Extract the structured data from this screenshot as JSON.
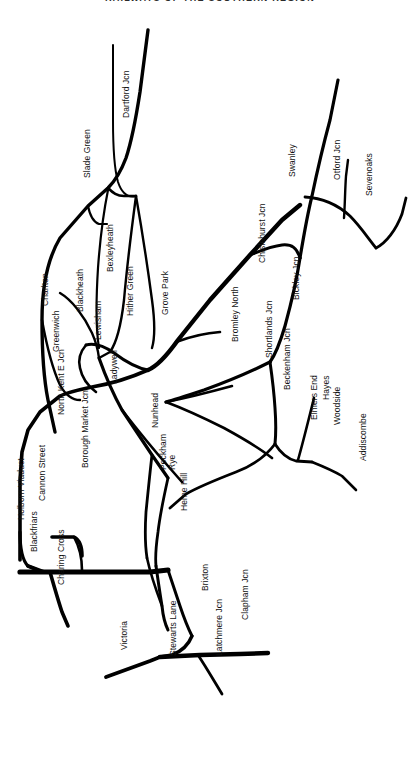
{
  "header": {
    "title": "RAILWAYS OF THE SOUTHERN REGION"
  },
  "map": {
    "name": "southern-region-railway-schematic",
    "background_color": "#ffffff",
    "line_color": "#000000",
    "label_color": "#111111",
    "width": 420,
    "height": 770,
    "label_orientation": "rotated -90 degrees (bottom-to-top)"
  },
  "stations": [
    {
      "id": "dartford-jcn",
      "label": "Dartford Jcn",
      "x": 122,
      "y": 118,
      "angle": -90
    },
    {
      "id": "slade-green",
      "label": "Slade Green",
      "x": 83,
      "y": 178,
      "angle": -90
    },
    {
      "id": "swanley",
      "label": "Swanley",
      "x": 288,
      "y": 177,
      "angle": -90
    },
    {
      "id": "otford-jcn",
      "label": "Otford Jcn",
      "x": 333,
      "y": 180,
      "angle": -90
    },
    {
      "id": "sevenoaks",
      "label": "Sevenoaks",
      "x": 365,
      "y": 196,
      "angle": -90
    },
    {
      "id": "bexleyheath",
      "label": "Bexleyheath",
      "x": 106,
      "y": 272,
      "angle": -90
    },
    {
      "id": "charlton",
      "label": "Charlton",
      "x": 41,
      "y": 306,
      "angle": -90
    },
    {
      "id": "blackheath",
      "label": "Blackheath",
      "x": 76,
      "y": 312,
      "angle": -90
    },
    {
      "id": "hither-green",
      "label": "Hither Green",
      "x": 126,
      "y": 316,
      "angle": -90
    },
    {
      "id": "chislehurst-jcn",
      "label": "Chislehurst Jcn",
      "x": 258,
      "y": 263,
      "angle": -90
    },
    {
      "id": "grove-park",
      "label": "Grove Park",
      "x": 161,
      "y": 315,
      "angle": -90
    },
    {
      "id": "bickley-jcn",
      "label": "Bickley Jcn",
      "x": 292,
      "y": 300,
      "angle": -90
    },
    {
      "id": "lewisham",
      "label": "Lewisham",
      "x": 94,
      "y": 340,
      "angle": -90
    },
    {
      "id": "greenwich",
      "label": "Greenwich",
      "x": 52,
      "y": 352,
      "angle": -90
    },
    {
      "id": "bromley-north",
      "label": "Bromley North",
      "x": 231,
      "y": 342,
      "angle": -90
    },
    {
      "id": "shortlands-jcn",
      "label": "Shortlands Jcn",
      "x": 265,
      "y": 358,
      "angle": -90
    },
    {
      "id": "ladywell",
      "label": "Ladywell",
      "x": 110,
      "y": 384,
      "angle": -90
    },
    {
      "id": "beckenham-jcn",
      "label": "Beckenham Jcn",
      "x": 283,
      "y": 390,
      "angle": -90
    },
    {
      "id": "hayes",
      "label": "Hayes",
      "x": 322,
      "y": 400,
      "angle": -90
    },
    {
      "id": "north-kent-e-jcn",
      "label": "North Kent E Jcn",
      "x": 57,
      "y": 415,
      "angle": -90
    },
    {
      "id": "elmers-end",
      "label": "Elmers End",
      "x": 310,
      "y": 420,
      "angle": -90
    },
    {
      "id": "woodside",
      "label": "Woodside",
      "x": 333,
      "y": 425,
      "angle": -90
    },
    {
      "id": "nunhead",
      "label": "Nunhead",
      "x": 151,
      "y": 428,
      "angle": -90
    },
    {
      "id": "borough-market-jcn",
      "label": "Borough Market Jcn",
      "x": 81,
      "y": 468,
      "angle": -90
    },
    {
      "id": "peckham-rye",
      "label": "Peckham\nRye",
      "x": 159,
      "y": 470,
      "angle": -90,
      "two_line": true
    },
    {
      "id": "addiscombe",
      "label": "Addiscombe",
      "x": 359,
      "y": 461,
      "angle": -90
    },
    {
      "id": "cannon-street",
      "label": "Cannon Street",
      "x": 38,
      "y": 501,
      "angle": -90
    },
    {
      "id": "herne-hill",
      "label": "Herne Hill",
      "x": 180,
      "y": 511,
      "angle": -90
    },
    {
      "id": "holborn-viaduct",
      "label": "Holborn Viaduct",
      "x": 17,
      "y": 520,
      "angle": -90
    },
    {
      "id": "blackfriars",
      "label": "Blackfriars",
      "x": 30,
      "y": 552,
      "angle": -90
    },
    {
      "id": "charing-cross",
      "label": "Charing Cross",
      "x": 57,
      "y": 585,
      "angle": -90
    },
    {
      "id": "brixton",
      "label": "Brixton",
      "x": 201,
      "y": 591,
      "angle": -90
    },
    {
      "id": "clapham-jcn",
      "label": "Clapham Jcn",
      "x": 241,
      "y": 620,
      "angle": -90
    },
    {
      "id": "victoria",
      "label": "Victoria",
      "x": 120,
      "y": 650,
      "angle": -90
    },
    {
      "id": "stewarts-lane",
      "label": "Stewarts Lane",
      "x": 169,
      "y": 656,
      "angle": -90
    },
    {
      "id": "latchmere-jcn",
      "label": "Latchmere Jcn",
      "x": 215,
      "y": 656,
      "angle": -90
    }
  ],
  "lines": [
    {
      "id": "dartford-main",
      "name": "Dartford Jcn to Slade Green / North Kent",
      "d": "M 148 30 L 140 92 C 136 118 132 140 126 158 C 120 174 114 182 108 188 L 88 206 L 60 238 C 48 258 42 285 42 320 C 42 355 44 380 48 400 L 55 432",
      "w": 3.4
    },
    {
      "id": "dartford-up",
      "name": "Dartford Jcn approach from north-east",
      "d": "M 113 45 L 113 120 C 113 148 114 168 118 182 C 122 194 128 198 136 196",
      "w": 2.0
    },
    {
      "id": "slade-green-link",
      "name": "Slade Green connecting curve",
      "d": "M 108 188 C 113 193 117 196 124 196 L 136 196",
      "w": 2.6
    },
    {
      "id": "bexleyheath-loop",
      "name": "Bexleyheath loop",
      "d": "M 108 190 C 104 210 100 240 98 268 C 96 300 96 330 99 348",
      "w": 2.2
    },
    {
      "id": "slade-green-spur",
      "name": "Slade Green spur",
      "d": "M 88 206 C 90 216 93 222 99 224 L 107 224",
      "w": 2.2
    },
    {
      "id": "dartford-lewisham",
      "name": "Dartford line to Lewisham via Blackheath",
      "d": "M 136 196 C 132 226 127 266 124 300 C 121 326 117 342 110 352 L 99 358",
      "w": 2.4
    },
    {
      "id": "hither-green-branch",
      "name": "Hither Green / Grove Park line",
      "d": "M 136 196 C 142 230 148 270 152 300 C 155 322 155 338 152 348",
      "w": 2.4
    },
    {
      "id": "greenwich-line",
      "name": "Greenwich line to North Kent East Jcn",
      "d": "M 42 320 C 46 342 52 368 60 385 C 66 396 72 400 80 400",
      "w": 2.4
    },
    {
      "id": "blackheath-link",
      "name": "Blackheath to Lewisham link",
      "d": "M 60 293 C 72 300 84 316 92 333 C 96 342 98 350 99 358",
      "w": 2.4
    },
    {
      "id": "lewisham-triangle-n",
      "name": "Lewisham triangle north side",
      "d": "M 86 345 C 94 343 104 346 114 353 C 126 362 136 368 148 370",
      "w": 3.0
    },
    {
      "id": "lewisham-triangle-w",
      "name": "Lewisham triangle west side",
      "d": "M 86 345 C 80 352 78 360 80 368 C 82 378 88 386 96 392",
      "w": 2.6
    },
    {
      "id": "lewisham-ladywell",
      "name": "Lewisham to Ladywell / Nunhead",
      "d": "M 99 358 C 104 372 112 392 122 410 L 152 455 L 168 478",
      "w": 3.2
    },
    {
      "id": "north-kent-main",
      "name": "North Kent East Jcn trunk to London Bridge",
      "d": "M 148 370 C 130 378 110 384 92 387 C 78 390 68 392 60 396 L 40 412 L 28 430 L 22 452 L 20 480 L 20 530 L 20 560",
      "w": 3.6
    },
    {
      "id": "grove-park-main",
      "name": "Grove Park main line to Chislehurst and Sevenoaks",
      "d": "M 148 370 C 158 366 168 354 178 340 L 210 300 L 250 255 L 282 220 L 300 205",
      "w": 4.4
    },
    {
      "id": "bromley-north-stub",
      "name": "Bromley North branch stub",
      "d": "M 176 342 C 192 336 206 333 220 332",
      "w": 2.6
    },
    {
      "id": "chislehurst-bickley",
      "name": "Chislehurst Jcn to Bickley Jcn chord",
      "d": "M 250 255 C 262 250 272 246 282 245 C 292 244 297 248 300 258",
      "w": 3.0
    },
    {
      "id": "bickley-swanley",
      "name": "Bickley Jcn to Swanley",
      "d": "M 300 258 C 303 240 307 216 312 196 C 317 172 323 146 330 120 L 338 80",
      "w": 3.2
    },
    {
      "id": "swanley-sevenoaks",
      "name": "Swanley to Sevenoaks curve",
      "d": "M 305 197 C 322 198 338 205 350 216 C 360 226 368 238 376 248",
      "w": 2.8
    },
    {
      "id": "otford-branch",
      "name": "Otford Jcn branch",
      "d": "M 344 218 C 345 204 345 190 346 176 L 348 160",
      "w": 2.4
    },
    {
      "id": "sevenoaks-out",
      "name": "Sevenoaks line to edge",
      "d": "M 376 248 C 386 243 396 230 402 214 L 406 198",
      "w": 2.8
    },
    {
      "id": "bickley-shortlands",
      "name": "Bickley Jcn to Shortlands Jcn",
      "d": "M 300 258 C 297 278 291 304 285 326 C 280 343 275 355 270 362",
      "w": 3.2
    },
    {
      "id": "shortlands-beckenham",
      "name": "Shortlands Jcn to Beckenham Jcn",
      "d": "M 270 362 C 272 376 274 392 275 408 C 276 422 276 434 275 444",
      "w": 3.0
    },
    {
      "id": "shortlands-west",
      "name": "Shortlands Jcn west chord to Nunhead line",
      "d": "M 270 362 C 250 372 226 382 204 390 C 186 396 174 400 166 402",
      "w": 3.2
    },
    {
      "id": "nunhead-shortlands",
      "name": "Nunhead to Shortlands via Peckham",
      "d": "M 166 402 C 182 408 204 418 224 428 C 246 440 262 450 272 458",
      "w": 2.6
    },
    {
      "id": "beckenham-elmers",
      "name": "Beckenham Jcn to Elmers End",
      "d": "M 275 444 C 280 452 288 459 296 461 L 312 462",
      "w": 2.8
    },
    {
      "id": "elmers-hayes",
      "name": "Elmers End to Hayes branch",
      "d": "M 298 460 C 302 446 306 430 310 414 L 314 398",
      "w": 2.6
    },
    {
      "id": "woodside-addiscombe",
      "name": "Woodside to Addiscombe branch",
      "d": "M 312 462 C 322 466 332 470 342 476 L 356 490",
      "w": 2.6
    },
    {
      "id": "beckenham-south",
      "name": "Beckenham Jcn line continuing south-west",
      "d": "M 275 444 C 266 456 252 466 236 472 C 218 479 200 486 186 494 L 170 508",
      "w": 2.8
    },
    {
      "id": "ladywell-south",
      "name": "Ladywell to Nunhead / Peckham diagonal",
      "d": "M 122 410 C 136 428 152 448 168 466 L 182 482",
      "w": 2.6
    },
    {
      "id": "nunhead-peckham",
      "name": "Nunhead to Peckham Rye",
      "d": "M 152 455 C 150 472 148 492 146 512 C 145 528 145 545 147 558",
      "w": 2.8
    },
    {
      "id": "peckham-herne",
      "name": "Peckham Rye to Herne Hill",
      "d": "M 168 478 C 164 496 160 514 158 532 C 156 546 155 556 156 566",
      "w": 2.8
    },
    {
      "id": "borough-market",
      "name": "Borough Market Jcn trunk west",
      "d": "M 20 572 L 60 572 L 110 572 L 150 572 L 168 570",
      "w": 5.2
    },
    {
      "id": "cannon-street-spur",
      "name": "Cannon Street spur",
      "d": "M 52 537 L 74 537 C 80 540 82 548 82 556",
      "w": 3.6
    },
    {
      "id": "borough-triangle",
      "name": "Borough Market junction triangle",
      "d": "M 74 537 C 80 548 82 560 82 570",
      "w": 2.6
    },
    {
      "id": "london-bridge-link",
      "name": "London Bridge to Borough Market",
      "d": "M 20 532 C 20 548 22 560 28 566 L 40 571",
      "w": 3.2
    },
    {
      "id": "holborn-blackfriars",
      "name": "Holborn Viaduct to Blackfriars",
      "d": "M 28 566 L 44 572",
      "w": 4.0
    },
    {
      "id": "charing-cross-line",
      "name": "Charing Cross approach",
      "d": "M 50 572 C 54 586 58 600 62 612 L 68 626",
      "w": 3.6
    },
    {
      "id": "blackfriars-south",
      "name": "Blackfriars to Herne Hill via Loughborough",
      "d": "M 42 572 L 70 572",
      "w": 4.0
    },
    {
      "id": "herne-hill-north",
      "name": "Herne Hill to Holborn Viaduct line",
      "d": "M 156 566 C 158 580 160 594 162 606 C 163 616 165 624 168 630",
      "w": 3.0
    },
    {
      "id": "herne-hill-brixton",
      "name": "Herne Hill to Brixton",
      "d": "M 168 570 C 172 582 176 594 180 606 C 184 618 188 628 192 636",
      "w": 3.0
    },
    {
      "id": "brixton-stewarts",
      "name": "Brixton to Stewarts Lane",
      "d": "M 192 636 C 188 646 180 652 172 655 L 160 657",
      "w": 3.4
    },
    {
      "id": "victoria-line",
      "name": "Victoria to Stewarts Lane",
      "d": "M 106 677 C 120 672 136 666 150 661 L 160 657",
      "w": 3.8
    },
    {
      "id": "stewarts-clapham",
      "name": "Stewarts Lane to Clapham Jcn",
      "d": "M 160 657 L 200 655 L 240 654 L 268 653",
      "w": 4.4
    },
    {
      "id": "latchmere-spur",
      "name": "Latchmere Jcn spur",
      "d": "M 198 655 C 204 664 210 674 216 684 L 222 694",
      "w": 2.8
    },
    {
      "id": "herne-hill-loop",
      "name": "Herne Hill western loop",
      "d": "M 147 558 C 150 572 156 590 162 606",
      "w": 2.6
    },
    {
      "id": "bromley-long",
      "name": "Long cross country chord",
      "d": "M 166 402 C 186 398 210 392 232 386",
      "w": 2.6
    }
  ]
}
